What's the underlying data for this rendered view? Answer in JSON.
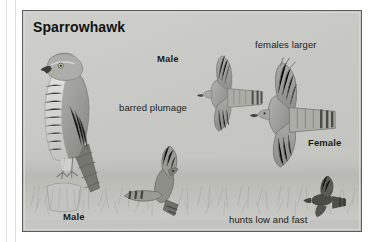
{
  "plate": {
    "title": "Sparrowhawk",
    "background_color": "#c9cac6",
    "frame_color": "#5d5d5d"
  },
  "labels": [
    {
      "id": "male-flight",
      "text": "Male",
      "bold": true,
      "x": 134,
      "y": 42
    },
    {
      "id": "barred",
      "text": "barred plumage",
      "bold": false,
      "x": 96,
      "y": 91
    },
    {
      "id": "females-larger",
      "text": "females larger",
      "bold": false,
      "x": 232,
      "y": 28
    },
    {
      "id": "female",
      "text": "Female",
      "bold": true,
      "x": 285,
      "y": 126
    },
    {
      "id": "male-perched",
      "text": "Male",
      "bold": true,
      "x": 40,
      "y": 200
    },
    {
      "id": "hunts",
      "text": "hunts low and fast",
      "bold": false,
      "x": 206,
      "y": 203
    }
  ],
  "figures": [
    {
      "id": "perched-male",
      "name": "perched male sparrowhawk on post",
      "sex": "male",
      "pose": "perched"
    },
    {
      "id": "flying-male",
      "name": "male sparrowhawk in flight",
      "sex": "male",
      "pose": "flying"
    },
    {
      "id": "flying-female",
      "name": "female sparrowhawk in flight",
      "sex": "female",
      "pose": "flying"
    },
    {
      "id": "hunting-bird-1",
      "name": "sparrowhawk hunting low over grass",
      "sex": "female",
      "pose": "flying-low"
    },
    {
      "id": "hunting-bird-2",
      "name": "distant sparrowhawk silhouette",
      "sex": "male",
      "pose": "flying-low"
    }
  ],
  "colors": {
    "plate_background": "#c9cac6",
    "frame": "#5d5d5d",
    "ink": "#1b1b1b",
    "bird_body": "#9a9a95",
    "bird_dark": "#3c3c3a",
    "grass": "#b9bab4"
  }
}
